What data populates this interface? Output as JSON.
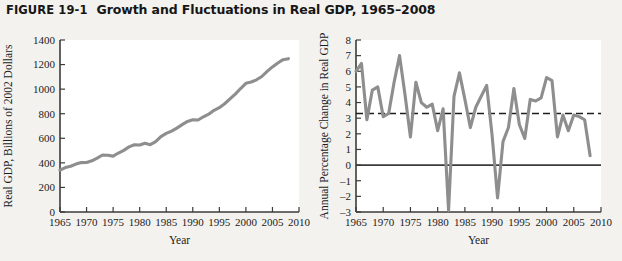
{
  "header": {
    "figure_number": "FIGURE 19-1",
    "title": "Growth and Fluctuations in Real GDP, 1965–2008"
  },
  "colors": {
    "page_background": "#f4f2ee",
    "plot_background": "#ffffff",
    "data_line": "#8e8e8e",
    "axis": "#3b3b3b",
    "average_line": "#1f1f1f",
    "text": "#1b1b1b"
  },
  "chart_data": [
    {
      "id": "real-gdp-level",
      "type": "line",
      "title": "",
      "xlabel": "Year",
      "ylabel": "Real GDP, Billions of 2002 Dollars",
      "xlim": [
        1965,
        2010
      ],
      "ylim": [
        0,
        1400
      ],
      "xticks": [
        1965,
        1970,
        1975,
        1980,
        1985,
        1990,
        1995,
        2000,
        2005,
        2010
      ],
      "yticks": [
        0,
        200,
        400,
        600,
        800,
        1000,
        1200,
        1400
      ],
      "grid": false,
      "legend": "none",
      "x": [
        1965,
        1966,
        1967,
        1968,
        1969,
        1970,
        1971,
        1972,
        1973,
        1974,
        1975,
        1976,
        1977,
        1978,
        1979,
        1980,
        1981,
        1982,
        1983,
        1984,
        1985,
        1986,
        1987,
        1988,
        1989,
        1990,
        1991,
        1992,
        1993,
        1994,
        1995,
        1996,
        1997,
        1998,
        1999,
        2000,
        2001,
        2002,
        2003,
        2004,
        2005,
        2006,
        2007,
        2008
      ],
      "values": [
        340,
        362,
        372,
        390,
        402,
        403,
        417,
        439,
        464,
        462,
        455,
        480,
        502,
        530,
        547,
        545,
        560,
        548,
        572,
        614,
        640,
        658,
        683,
        711,
        737,
        751,
        749,
        775,
        796,
        828,
        849,
        881,
        921,
        960,
        1005,
        1047,
        1058,
        1076,
        1103,
        1145,
        1181,
        1213,
        1240,
        1248
      ],
      "series": [
        {
          "name": "Real GDP",
          "values": [
            340,
            362,
            372,
            390,
            402,
            403,
            417,
            439,
            464,
            462,
            455,
            480,
            502,
            530,
            547,
            545,
            560,
            548,
            572,
            614,
            640,
            658,
            683,
            711,
            737,
            751,
            749,
            775,
            796,
            828,
            849,
            881,
            921,
            960,
            1005,
            1047,
            1058,
            1076,
            1103,
            1145,
            1181,
            1213,
            1240,
            1248
          ]
        }
      ]
    },
    {
      "id": "real-gdp-growth",
      "type": "line",
      "title": "",
      "xlabel": "Year",
      "ylabel": "Annual Percentage Change in Real GDP",
      "xlim": [
        1965,
        2010
      ],
      "ylim": [
        -3,
        8
      ],
      "xticks": [
        1965,
        1970,
        1975,
        1980,
        1985,
        1990,
        1995,
        2000,
        2005,
        2010
      ],
      "yticks": [
        -3,
        -2,
        -1,
        0,
        1,
        2,
        3,
        4,
        5,
        6,
        7,
        8
      ],
      "grid": false,
      "legend": "none",
      "reference_lines": [
        {
          "name": "zero-line",
          "value": 0,
          "style": "solid"
        },
        {
          "name": "average-growth-line",
          "value": 3.3,
          "style": "dashed"
        }
      ],
      "x": [
        1965,
        1966,
        1967,
        1968,
        1969,
        1970,
        1971,
        1972,
        1973,
        1974,
        1975,
        1976,
        1977,
        1978,
        1979,
        1980,
        1981,
        1982,
        1983,
        1984,
        1985,
        1986,
        1987,
        1988,
        1989,
        1990,
        1991,
        1992,
        1993,
        1994,
        1995,
        1996,
        1997,
        1998,
        1999,
        2000,
        2001,
        2002,
        2003,
        2004,
        2005,
        2006,
        2007,
        2008
      ],
      "values": [
        6.0,
        6.5,
        2.9,
        4.8,
        5.0,
        3.1,
        3.3,
        5.3,
        7.0,
        4.5,
        1.8,
        5.3,
        4.0,
        3.7,
        3.9,
        2.2,
        3.6,
        -2.9,
        4.4,
        5.9,
        4.2,
        2.4,
        3.7,
        4.4,
        5.1,
        1.9,
        -2.1,
        1.5,
        2.4,
        4.9,
        2.6,
        1.7,
        4.2,
        4.1,
        4.3,
        5.6,
        5.4,
        1.8,
        3.2,
        2.2,
        3.2,
        3.1,
        2.9,
        0.6
      ],
      "series": [
        {
          "name": "Annual Percentage Change in Real GDP",
          "values": [
            6.0,
            6.5,
            2.9,
            4.8,
            5.0,
            3.1,
            3.3,
            5.3,
            7.0,
            4.5,
            1.8,
            5.3,
            4.0,
            3.7,
            3.9,
            2.2,
            3.6,
            -2.9,
            4.4,
            5.9,
            4.2,
            2.4,
            3.7,
            4.4,
            5.1,
            1.9,
            -2.1,
            1.5,
            2.4,
            4.9,
            2.6,
            1.7,
            4.2,
            4.1,
            4.3,
            5.6,
            5.4,
            1.8,
            3.2,
            2.2,
            3.2,
            3.1,
            2.9,
            0.6
          ]
        }
      ]
    }
  ]
}
